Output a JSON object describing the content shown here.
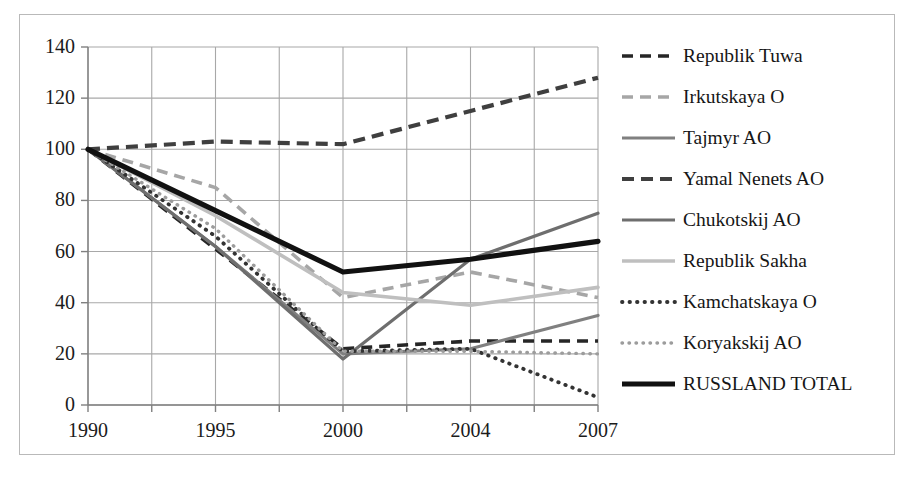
{
  "chart_data": {
    "type": "line",
    "title": "",
    "xlabel": "",
    "ylabel": "",
    "categories": [
      "1990",
      "1995",
      "2000",
      "2004",
      "2007"
    ],
    "x": [
      "1990",
      "1995",
      "2000",
      "2004",
      "2007"
    ],
    "ylim": [
      0,
      140
    ],
    "yticks": [
      0,
      20,
      40,
      60,
      80,
      100,
      120,
      140
    ],
    "ytick_labels": [
      "0",
      "20",
      "40",
      "60",
      "80",
      "100",
      "120",
      "140"
    ],
    "grid": true,
    "grid_major_horizontal": true,
    "grid_minor_vertical": true,
    "legend_position": "right",
    "series": [
      {
        "name": "Republik Tuwa",
        "values": [
          100,
          61,
          22,
          25,
          25
        ],
        "color": "#262626",
        "style": "dashed",
        "width": 3.6,
        "dasharray": "11,7"
      },
      {
        "name": "Irkutskaya O",
        "values": [
          100,
          85,
          42,
          52,
          42
        ],
        "color": "#a6a6a6",
        "style": "dashed",
        "width": 3.6,
        "dasharray": "11,7"
      },
      {
        "name": "Tajmyr AO",
        "values": [
          100,
          62,
          20,
          22,
          35
        ],
        "color": "#808080",
        "style": "solid",
        "width": 3.2,
        "dasharray": "none"
      },
      {
        "name": "Yamal Nenets AO",
        "values": [
          100,
          103,
          102,
          115,
          128
        ],
        "color": "#3f3f3f",
        "style": "dashed",
        "width": 4.2,
        "dasharray": "12,7"
      },
      {
        "name": "Chukotskij AO",
        "values": [
          100,
          62,
          18,
          57,
          75
        ],
        "color": "#6e6e6e",
        "style": "solid",
        "width": 3.2,
        "dasharray": "none"
      },
      {
        "name": "Republik Sakha",
        "values": [
          100,
          74,
          44,
          39,
          46
        ],
        "color": "#bfbfbf",
        "style": "solid",
        "width": 3.6,
        "dasharray": "none"
      },
      {
        "name": "Kamchatskaya O",
        "values": [
          100,
          66,
          21,
          22,
          3
        ],
        "color": "#333333",
        "style": "dotted",
        "width": 3.8,
        "dasharray": "0.5,7"
      },
      {
        "name": "Koryakskij AO",
        "values": [
          100,
          69,
          21,
          21,
          20
        ],
        "color": "#9c9c9c",
        "style": "dotted",
        "width": 3.4,
        "dasharray": "0.5,6.5"
      },
      {
        "name": "RUSSLAND TOTAL",
        "values": [
          100,
          76,
          52,
          57,
          64
        ],
        "color": "#111111",
        "style": "solid",
        "width": 5.2,
        "dasharray": "none"
      }
    ]
  },
  "legend": {
    "items": [
      {
        "label": "Republik Tuwa"
      },
      {
        "label": "Irkutskaya O"
      },
      {
        "label": "Tajmyr AO"
      },
      {
        "label": "Yamal Nenets AO"
      },
      {
        "label": "Chukotskij AO"
      },
      {
        "label": "Republik Sakha"
      },
      {
        "label": "Kamchatskaya O"
      },
      {
        "label": "Koryakskij AO"
      },
      {
        "label": "RUSSLAND TOTAL"
      }
    ]
  },
  "axes": {
    "y_labels": [
      "140",
      "120",
      "100",
      "80",
      "60",
      "40",
      "20",
      "0"
    ],
    "x_labels": [
      "1990",
      "1995",
      "2000",
      "2004",
      "2007"
    ]
  },
  "colors": {
    "background": "#ffffff",
    "border": "#b9b9b9",
    "grid": "#a8a8a8",
    "axis": "#808080",
    "text": "#1b1b1b"
  }
}
